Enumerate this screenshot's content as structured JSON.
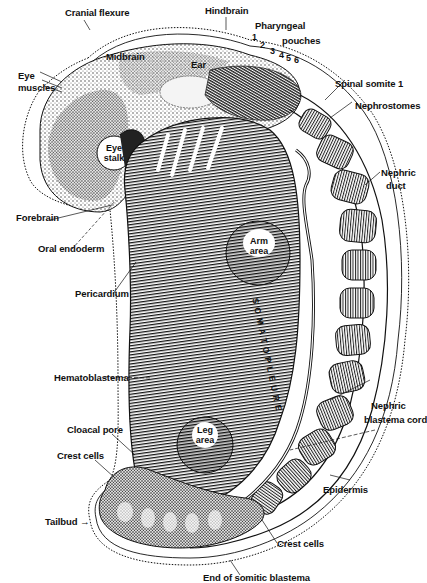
{
  "diagram": {
    "labels": {
      "cranial_flexure": "Cranial flexure",
      "hindbrain": "Hindbrain",
      "pharyngeal_pouches": "Pharyngeal pouches",
      "pharyngeal_pouches_line1": "Pharyngeal",
      "pharyngeal_pouches_line2": "pouches",
      "midbrain": "Midbrain",
      "ear": "Ear",
      "eye_muscles_line1": "Eye",
      "eye_muscles_line2": "muscles",
      "spinal_somite_1": "Spinal somite 1",
      "nephrostomes": "Nephrostomes",
      "eye_stalk_line1": "Eye",
      "eye_stalk_line2": "stalk",
      "nephric_duct_line1": "Nephric",
      "nephric_duct_line2": "duct",
      "forebrain": "Forebrain",
      "oral_endoderm": "Oral endoderm",
      "arm_area_line1": "Arm",
      "arm_area_line2": "area",
      "pericardium": "Pericardium",
      "somatopleure": "SOMATOPLEURE",
      "hematoblastema": "Hematoblastema",
      "nephric_blastema_cord_line1": "Nephric",
      "nephric_blastema_cord_line2": "blastema cord",
      "leg_area_line1": "Leg",
      "leg_area_line2": "area",
      "cloacal_pore": "Cloacal pore",
      "crest_cells_upper": "Crest cells",
      "epidermis": "Epidermis",
      "tailbud": "Tailbud →",
      "crest_cells_lower": "Crest cells",
      "end_of_somitic_blastema": "End of somitic blastema"
    },
    "pouch_numbers": [
      "1",
      "2",
      "3",
      "4",
      "5",
      "6"
    ],
    "colors": {
      "ink": "#111111",
      "paper": "#ffffff",
      "stipple": "#555555"
    }
  }
}
